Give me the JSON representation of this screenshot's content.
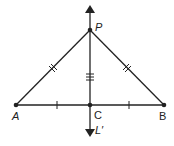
{
  "diagram": {
    "type": "geometry",
    "points": {
      "P": {
        "label": "P",
        "x": 90,
        "y": 30
      },
      "A": {
        "label": "A",
        "x": 16,
        "y": 105
      },
      "B": {
        "label": "B",
        "x": 164,
        "y": 105
      },
      "C": {
        "label": "C",
        "x": 90,
        "y": 105
      }
    },
    "line": {
      "label": "L′"
    },
    "markings": {
      "AP": "double tick (congruent to PB)",
      "PB": "double tick (congruent to AP)",
      "PC": "triple tick",
      "AC": "single tick (congruent to CB)",
      "CB": "single tick (congruent to AC)"
    },
    "colors": {
      "stroke": "#222222",
      "background": "#ffffff"
    }
  }
}
